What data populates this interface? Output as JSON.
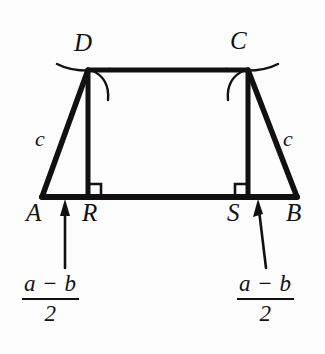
{
  "figure": {
    "background_color": "#fdfdfd",
    "ink_color": "#111111",
    "vertex_labels": [
      {
        "name": "D",
        "text": "D",
        "x": 74,
        "y": 30
      },
      {
        "name": "C",
        "text": "C",
        "x": 230,
        "y": 28
      },
      {
        "name": "A",
        "text": "A",
        "x": 26,
        "y": 200
      },
      {
        "name": "R",
        "text": "R",
        "x": 82,
        "y": 200
      },
      {
        "name": "S",
        "text": "S",
        "x": 227,
        "y": 200
      },
      {
        "name": "B",
        "text": "B",
        "x": 286,
        "y": 200
      }
    ],
    "side_labels": [
      {
        "name": "leg-left",
        "text": "c",
        "x": 35,
        "y": 128
      },
      {
        "name": "leg-right",
        "text": "c",
        "x": 283,
        "y": 128
      }
    ],
    "fractions": [
      {
        "name": "left",
        "numerator": "a − b",
        "denominator": "2",
        "x": 22,
        "y": 272
      },
      {
        "name": "right",
        "numerator": "a − b",
        "denominator": "2",
        "x": 237,
        "y": 272
      }
    ],
    "geometry": {
      "A": [
        42,
        197
      ],
      "B": [
        297,
        197
      ],
      "C": [
        248,
        70
      ],
      "D": [
        88,
        70
      ],
      "R": [
        88,
        197
      ],
      "S": [
        248,
        197
      ],
      "right_angle_marker_size": 13
    }
  }
}
